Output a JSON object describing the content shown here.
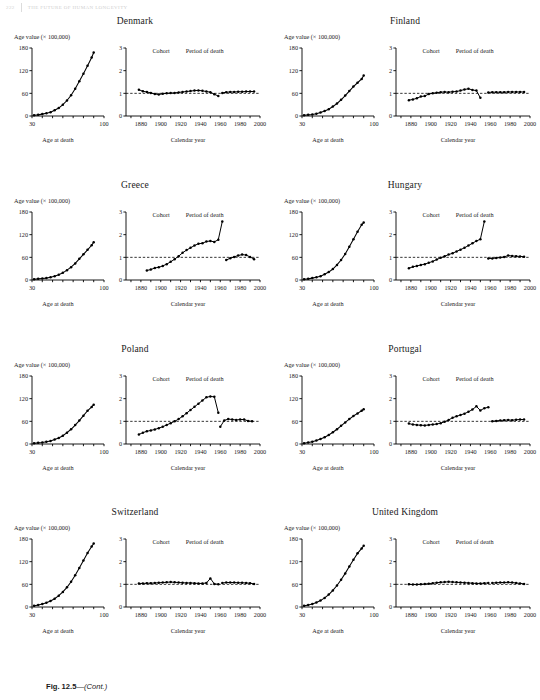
{
  "running_head": {
    "page": "222",
    "text": "THE FUTURE OF HUMAN LONGEVITY"
  },
  "caption": {
    "figure": "Fig. 12.5",
    "dash": "—",
    "cont": "(Cont.)"
  },
  "labels": {
    "y_axis_left": "Age value (× 100,000)",
    "x_axis_left": "Age at death",
    "x_axis_right": "Calendar year",
    "legend_cohort": "Cohort",
    "legend_period": "Period of death"
  },
  "axes": {
    "left": {
      "xticks": [
        30,
        100
      ],
      "yticks": [
        0,
        60,
        120,
        180
      ],
      "xlim": [
        30,
        100
      ],
      "ylim": [
        0,
        180
      ]
    },
    "right": {
      "xticks": [
        1880,
        1900,
        1920,
        1940,
        1960,
        1980,
        2000
      ],
      "yticks": [
        0,
        1,
        2,
        3
      ],
      "xlim": [
        1865,
        2000
      ],
      "ylim": [
        0,
        3
      ],
      "reference_line": 1
    }
  },
  "chart_data": [
    {
      "type": "line",
      "country": "Denmark",
      "left": {
        "xlabel": "Age at death",
        "ylabel": "Age value (× 100,000)",
        "x": [
          32,
          36,
          40,
          44,
          48,
          52,
          56,
          60,
          64,
          68,
          72,
          76,
          80,
          84,
          88,
          90
        ],
        "y": [
          2,
          3,
          5,
          7,
          10,
          15,
          21,
          30,
          41,
          55,
          72,
          92,
          112,
          133,
          155,
          168
        ]
      },
      "right": {
        "xlabel": "Calendar year",
        "series": [
          {
            "name": "Cohort",
            "x": [
              1878,
              1882,
              1886,
              1890,
              1894,
              1898,
              1902,
              1906,
              1910,
              1914,
              1918,
              1922,
              1926,
              1930,
              1934,
              1938,
              1942,
              1946,
              1950,
              1954,
              1958
            ],
            "y": [
              1.16,
              1.09,
              1.06,
              1.02,
              0.97,
              0.95,
              0.98,
              1.0,
              1.01,
              1.02,
              1.04,
              1.06,
              1.08,
              1.1,
              1.12,
              1.13,
              1.11,
              1.08,
              1.05,
              0.96,
              0.88
            ]
          },
          {
            "name": "Period of death",
            "x": [
              1962,
              1966,
              1970,
              1974,
              1978,
              1982,
              1986,
              1990,
              1994
            ],
            "y": [
              1.02,
              1.05,
              1.06,
              1.06,
              1.07,
              1.07,
              1.08,
              1.08,
              1.08
            ]
          }
        ]
      }
    },
    {
      "type": "line",
      "country": "Finland",
      "left": {
        "xlabel": "Age at death",
        "ylabel": "Age value (× 100,000)",
        "x": [
          32,
          36,
          40,
          44,
          48,
          52,
          56,
          60,
          64,
          68,
          72,
          76,
          80,
          84,
          88,
          90
        ],
        "y": [
          2,
          3,
          4,
          6,
          9,
          13,
          18,
          25,
          33,
          43,
          54,
          66,
          78,
          88,
          98,
          107
        ]
      },
      "right": {
        "xlabel": "Calendar year",
        "series": [
          {
            "name": "Cohort",
            "x": [
              1878,
              1882,
              1886,
              1890,
              1894,
              1898,
              1902,
              1906,
              1910,
              1914,
              1918,
              1922,
              1926,
              1930,
              1934,
              1938,
              1942,
              1946,
              1950
            ],
            "y": [
              0.7,
              0.73,
              0.78,
              0.86,
              0.88,
              0.97,
              1.0,
              1.03,
              1.05,
              1.06,
              1.05,
              1.07,
              1.08,
              1.12,
              1.17,
              1.2,
              1.15,
              1.12,
              0.8
            ]
          },
          {
            "name": "Period of death",
            "x": [
              1958,
              1962,
              1966,
              1970,
              1974,
              1978,
              1982,
              1986,
              1990,
              1994
            ],
            "y": [
              1.04,
              1.05,
              1.05,
              1.05,
              1.05,
              1.06,
              1.06,
              1.06,
              1.06,
              1.06
            ]
          }
        ]
      }
    },
    {
      "type": "line",
      "country": "Greece",
      "left": {
        "xlabel": "Age at death",
        "ylabel": "Age value (× 100,000)",
        "x": [
          32,
          36,
          40,
          44,
          48,
          52,
          56,
          60,
          64,
          68,
          72,
          76,
          80,
          84,
          88,
          90
        ],
        "y": [
          2,
          3,
          4,
          5,
          7,
          10,
          14,
          19,
          26,
          34,
          44,
          56,
          68,
          80,
          92,
          100
        ]
      },
      "right": {
        "xlabel": "Calendar year",
        "series": [
          {
            "name": "Cohort",
            "x": [
              1886,
              1890,
              1894,
              1898,
              1902,
              1906,
              1910,
              1914,
              1918,
              1922,
              1926,
              1930,
              1934,
              1938,
              1942,
              1946,
              1950,
              1954,
              1958,
              1962
            ],
            "y": [
              0.42,
              0.46,
              0.53,
              0.56,
              0.62,
              0.7,
              0.8,
              0.92,
              1.05,
              1.2,
              1.32,
              1.42,
              1.52,
              1.6,
              1.62,
              1.7,
              1.72,
              1.68,
              1.78,
              2.58
            ]
          },
          {
            "name": "Period of death",
            "x": [
              1966,
              1970,
              1974,
              1978,
              1982,
              1986,
              1990,
              1994
            ],
            "y": [
              0.88,
              0.96,
              1.02,
              1.08,
              1.12,
              1.1,
              1.02,
              0.92
            ]
          }
        ]
      }
    },
    {
      "type": "line",
      "country": "Hungary",
      "left": {
        "xlabel": "Age at death",
        "ylabel": "Age value (× 100,000)",
        "x": [
          32,
          36,
          40,
          44,
          48,
          52,
          56,
          60,
          64,
          68,
          72,
          76,
          80,
          84,
          88,
          90
        ],
        "y": [
          2,
          3,
          5,
          7,
          10,
          15,
          21,
          29,
          40,
          53,
          69,
          88,
          108,
          128,
          146,
          152
        ]
      },
      "right": {
        "xlabel": "Calendar year",
        "series": [
          {
            "name": "Cohort",
            "x": [
              1878,
              1882,
              1886,
              1890,
              1894,
              1898,
              1902,
              1906,
              1910,
              1914,
              1918,
              1922,
              1926,
              1930,
              1934,
              1938,
              1942,
              1946,
              1950,
              1954
            ],
            "y": [
              0.52,
              0.58,
              0.62,
              0.66,
              0.7,
              0.76,
              0.82,
              0.9,
              0.98,
              1.05,
              1.12,
              1.18,
              1.26,
              1.34,
              1.42,
              1.52,
              1.62,
              1.72,
              1.8,
              2.58
            ]
          },
          {
            "name": "Period of death",
            "x": [
              1958,
              1962,
              1966,
              1970,
              1974,
              1978,
              1982,
              1986,
              1990,
              1994
            ],
            "y": [
              0.95,
              0.95,
              0.97,
              0.99,
              1.02,
              1.08,
              1.06,
              1.05,
              1.04,
              1.03
            ]
          }
        ]
      }
    },
    {
      "type": "line",
      "country": "Poland",
      "left": {
        "xlabel": "Age at death",
        "ylabel": "Age value (× 100,000)",
        "x": [
          32,
          36,
          40,
          44,
          48,
          52,
          56,
          60,
          64,
          68,
          72,
          76,
          80,
          84,
          88,
          90
        ],
        "y": [
          2,
          3,
          4,
          6,
          8,
          12,
          16,
          22,
          30,
          39,
          50,
          62,
          75,
          88,
          98,
          104
        ]
      },
      "right": {
        "xlabel": "Calendar year",
        "series": [
          {
            "name": "Cohort",
            "x": [
              1878,
              1882,
              1886,
              1890,
              1894,
              1898,
              1902,
              1906,
              1910,
              1914,
              1918,
              1922,
              1926,
              1930,
              1934,
              1938,
              1942,
              1946,
              1950,
              1954,
              1958
            ],
            "y": [
              0.42,
              0.5,
              0.56,
              0.6,
              0.64,
              0.7,
              0.76,
              0.84,
              0.92,
              1.0,
              1.1,
              1.22,
              1.36,
              1.5,
              1.64,
              1.78,
              1.92,
              2.06,
              2.1,
              2.08,
              1.38
            ]
          },
          {
            "name": "Period of death",
            "x": [
              1960,
              1964,
              1968,
              1972,
              1976,
              1980,
              1984,
              1988,
              1992
            ],
            "y": [
              0.76,
              1.04,
              1.1,
              1.08,
              1.06,
              1.08,
              1.08,
              1.02,
              1.0
            ]
          }
        ]
      }
    },
    {
      "type": "line",
      "country": "Portugal",
      "left": {
        "xlabel": "Age at death",
        "ylabel": "Age value (× 100,000)",
        "x": [
          32,
          36,
          40,
          44,
          48,
          52,
          56,
          60,
          64,
          68,
          72,
          76,
          80,
          84,
          88,
          90
        ],
        "y": [
          2,
          4,
          6,
          9,
          13,
          18,
          24,
          31,
          39,
          48,
          57,
          66,
          74,
          81,
          88,
          92
        ]
      },
      "right": {
        "xlabel": "Calendar year",
        "series": [
          {
            "name": "Cohort",
            "x": [
              1878,
              1882,
              1886,
              1890,
              1894,
              1898,
              1902,
              1906,
              1910,
              1914,
              1918,
              1922,
              1926,
              1930,
              1934,
              1938,
              1942,
              1946,
              1950,
              1954,
              1958
            ],
            "y": [
              0.9,
              0.86,
              0.84,
              0.83,
              0.82,
              0.84,
              0.86,
              0.88,
              0.92,
              0.98,
              1.06,
              1.16,
              1.22,
              1.28,
              1.34,
              1.42,
              1.52,
              1.66,
              1.48,
              1.58,
              1.62
            ]
          },
          {
            "name": "Period of death",
            "x": [
              1962,
              1966,
              1970,
              1974,
              1978,
              1982,
              1986,
              1990,
              1994
            ],
            "y": [
              1.0,
              1.02,
              1.04,
              1.05,
              1.06,
              1.05,
              1.07,
              1.08,
              1.08
            ]
          }
        ]
      }
    },
    {
      "type": "line",
      "country": "Switzerland",
      "left": {
        "xlabel": "Age at death",
        "ylabel": "Age value (× 100,000)",
        "x": [
          32,
          36,
          40,
          44,
          48,
          52,
          56,
          60,
          64,
          68,
          72,
          76,
          80,
          84,
          88,
          90
        ],
        "y": [
          3,
          5,
          8,
          11,
          16,
          22,
          30,
          40,
          52,
          67,
          84,
          103,
          123,
          143,
          160,
          168
        ]
      },
      "right": {
        "xlabel": "Calendar year",
        "series": [
          {
            "name": "Cohort",
            "x": [
              1878,
              1882,
              1886,
              1890,
              1894,
              1898,
              1902,
              1906,
              1910,
              1914,
              1918,
              1922,
              1926,
              1930,
              1934,
              1938,
              1942,
              1946,
              1950,
              1954,
              1958
            ],
            "y": [
              1.04,
              1.04,
              1.05,
              1.05,
              1.06,
              1.07,
              1.08,
              1.09,
              1.1,
              1.09,
              1.08,
              1.07,
              1.06,
              1.06,
              1.05,
              1.04,
              1.04,
              1.06,
              1.26,
              1.02,
              1.0
            ]
          },
          {
            "name": "Period of death",
            "x": [
              1962,
              1966,
              1970,
              1974,
              1978,
              1982,
              1986,
              1990,
              1994
            ],
            "y": [
              1.06,
              1.08,
              1.08,
              1.08,
              1.07,
              1.07,
              1.06,
              1.05,
              1.02
            ]
          }
        ]
      }
    },
    {
      "type": "line",
      "country": "United Kingdom",
      "left": {
        "xlabel": "Age at death",
        "ylabel": "Age value (× 100,000)",
        "x": [
          32,
          36,
          40,
          44,
          48,
          52,
          56,
          60,
          64,
          68,
          72,
          76,
          80,
          84,
          88,
          90
        ],
        "y": [
          3,
          5,
          8,
          12,
          17,
          24,
          33,
          44,
          57,
          72,
          89,
          107,
          125,
          142,
          155,
          162
        ]
      },
      "right": {
        "xlabel": "Calendar year",
        "series": [
          {
            "name": "Cohort",
            "x": [
              1878,
              1882,
              1886,
              1890,
              1894,
              1898,
              1902,
              1906,
              1910,
              1914,
              1918,
              1922,
              1926,
              1930,
              1934,
              1938,
              1942,
              1946,
              1950,
              1954,
              1958
            ],
            "y": [
              1.0,
              0.99,
              0.99,
              1.0,
              1.01,
              1.03,
              1.05,
              1.07,
              1.09,
              1.1,
              1.11,
              1.1,
              1.09,
              1.08,
              1.07,
              1.06,
              1.05,
              1.04,
              1.04,
              1.05,
              1.06
            ]
          },
          {
            "name": "Period of death",
            "x": [
              1962,
              1966,
              1970,
              1974,
              1978,
              1982,
              1986,
              1990,
              1994
            ],
            "y": [
              1.06,
              1.07,
              1.08,
              1.08,
              1.09,
              1.08,
              1.06,
              1.04,
              1.02
            ]
          }
        ]
      }
    }
  ]
}
